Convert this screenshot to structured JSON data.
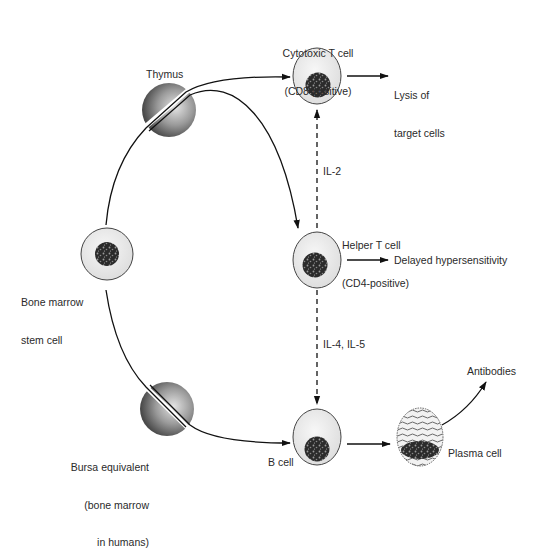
{
  "diagram": {
    "type": "immune-cell-differentiation-flow",
    "colors": {
      "line": "#111111",
      "cell_fill": "#ececec",
      "cell_stroke": "#333333",
      "nucleus": "#2b2b2b",
      "organ_light": "#d8d8d8",
      "organ_dark": "#555555",
      "text": "#2a2a2a"
    },
    "nodes": {
      "thymus": {
        "label": "Thymus",
        "kind": "organ"
      },
      "bone_marrow_stem_cell": {
        "label_line1": "Bone marrow",
        "label_line2": "stem cell",
        "kind": "cell"
      },
      "bursa_equivalent": {
        "label_line1": "Bursa equivalent",
        "label_line2": "(bone marrow",
        "label_line3": "in humans)",
        "kind": "organ"
      },
      "cytotoxic_t_cell": {
        "label_line1": "Cytotoxic T cell",
        "label_line2": "(CD8-positive)",
        "kind": "cell"
      },
      "helper_t_cell": {
        "label_line1": "Helper T cell",
        "label_line2": "(CD4-positive)",
        "kind": "cell"
      },
      "b_cell": {
        "label": "B cell",
        "kind": "cell"
      },
      "plasma_cell": {
        "label": "Plasma cell",
        "kind": "cell"
      }
    },
    "outcomes": {
      "cytotoxic": {
        "line1": "Lysis of",
        "line2": "target cells"
      },
      "helper": {
        "label": "Delayed hypersensitivity"
      },
      "plasma": {
        "label": "Antibodies"
      }
    },
    "signals": {
      "helper_to_cytotoxic": "IL-2",
      "helper_to_b": "IL-4, IL-5"
    },
    "edges": [
      {
        "from": "bone_marrow_stem_cell",
        "via": "thymus",
        "to": "cytotoxic_t_cell",
        "style": "solid"
      },
      {
        "from": "bone_marrow_stem_cell",
        "via": "thymus",
        "to": "helper_t_cell",
        "style": "solid"
      },
      {
        "from": "bone_marrow_stem_cell",
        "via": "bursa_equivalent",
        "to": "b_cell",
        "style": "solid"
      },
      {
        "from": "helper_t_cell",
        "to": "cytotoxic_t_cell",
        "style": "dashed",
        "label": "IL-2"
      },
      {
        "from": "helper_t_cell",
        "to": "b_cell",
        "style": "dashed",
        "label": "IL-4, IL-5"
      },
      {
        "from": "cytotoxic_t_cell",
        "to": "lysis_of_target_cells",
        "style": "solid"
      },
      {
        "from": "helper_t_cell",
        "to": "delayed_hypersensitivity",
        "style": "solid"
      },
      {
        "from": "b_cell",
        "to": "plasma_cell",
        "style": "solid"
      },
      {
        "from": "plasma_cell",
        "to": "antibodies",
        "style": "solid"
      }
    ]
  }
}
